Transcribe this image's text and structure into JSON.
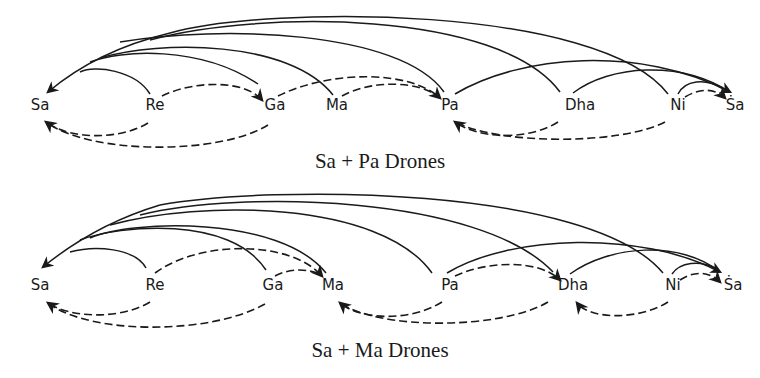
{
  "diagrams": [
    {
      "caption": "Sa + Pa Drones",
      "caption_pos": [
        380,
        168
      ],
      "label_y": 110,
      "notes": [
        {
          "id": "sa",
          "label": "Sa",
          "x": 40
        },
        {
          "id": "re",
          "label": "Re",
          "x": 155
        },
        {
          "id": "ga",
          "label": "Ga",
          "x": 275
        },
        {
          "id": "ma",
          "label": "Ma",
          "x": 337
        },
        {
          "id": "pa",
          "label": "Pa",
          "x": 450
        },
        {
          "id": "dha",
          "label": "Dha",
          "x": 580
        },
        {
          "id": "ni",
          "label": "Ni",
          "x": 678
        },
        {
          "id": "sa_upper",
          "label": "Ṡa",
          "x": 735
        }
      ],
      "solid_arcs": [
        {
          "from": "re",
          "to": "sa",
          "d": "M150,94 C135,70 95,65 80,72"
        },
        {
          "from": "ga",
          "to": "sa",
          "d": "M258,84 C200,45 120,50 90,62"
        },
        {
          "from": "ma",
          "to": "sa",
          "d": "M333,95 C290,40 160,40 100,58"
        },
        {
          "from": "pa",
          "to": "sa",
          "d": "M444,92 C400,30 220,25 120,42"
        },
        {
          "from": "dha",
          "to": "sa",
          "d": "M560,92 C500,10 260,10 150,40"
        },
        {
          "from": "ni",
          "to": "sa",
          "d": "M668,94 C600,5 270,5 170,33"
        },
        {
          "from": "sa_tail",
          "to": "sa",
          "d": "M170,33 C120,45 80,65 48,92",
          "arrow": "end"
        },
        {
          "from": "pa",
          "to": "sa_upper",
          "d": "M455,94 C520,55 640,45 730,92",
          "arrow": "end"
        },
        {
          "from": "dha",
          "to": "sa_upper",
          "d": "M573,93 C610,65 680,60 730,92"
        },
        {
          "from": "ni",
          "to": "sa_upper",
          "d": "M678,94 C685,80 705,78 722,88"
        }
      ],
      "dashed_arcs": [
        {
          "from": "re",
          "to": "ga",
          "d": "M162,96 C195,80 245,80 262,100",
          "arrow": "end"
        },
        {
          "from": "ga",
          "to": "pa",
          "d": "M278,96 C330,70 410,70 440,98",
          "arrow": "end"
        },
        {
          "from": "ma",
          "to": "pa",
          "d": "M342,96 C370,80 420,80 440,98"
        },
        {
          "from": "ni",
          "to": "sa_upper",
          "d": "M685,97 C700,88 715,88 725,98",
          "arrow": "end"
        },
        {
          "from": "re",
          "to": "sa",
          "d": "M148,123 C120,140 70,140 46,122",
          "arrow": "end"
        },
        {
          "from": "ga",
          "to": "sa",
          "d": "M268,125 C220,155 90,155 46,122"
        },
        {
          "from": "dha",
          "to": "pa",
          "d": "M558,122 C530,140 480,140 455,122",
          "arrow": "end"
        },
        {
          "from": "ni",
          "to": "pa",
          "d": "M665,122 C620,145 500,145 455,122"
        }
      ]
    },
    {
      "caption": "Sa + Ma Drones",
      "caption_pos": [
        380,
        357
      ],
      "label_y": 290,
      "notes": [
        {
          "id": "sa",
          "label": "Sa",
          "x": 40
        },
        {
          "id": "re",
          "label": "Re",
          "x": 155
        },
        {
          "id": "ga",
          "label": "Ga",
          "x": 273
        },
        {
          "id": "ma",
          "label": "Ma",
          "x": 333
        },
        {
          "id": "pa",
          "label": "Pa",
          "x": 450
        },
        {
          "id": "dha",
          "label": "Dha",
          "x": 573
        },
        {
          "id": "ni",
          "label": "Ni",
          "x": 673
        },
        {
          "id": "sa_upper",
          "label": "Ṡa",
          "x": 733
        }
      ],
      "solid_arcs": [
        {
          "from": "re",
          "to": "sa",
          "d": "M146,268 C135,248 95,245 70,252"
        },
        {
          "from": "ga",
          "to": "sa",
          "d": "M266,270 C230,215 120,225 80,240"
        },
        {
          "from": "ma",
          "to": "sa",
          "d": "M326,273 C280,215 130,220 90,238"
        },
        {
          "from": "pa",
          "to": "sa",
          "d": "M432,273 C380,200 200,200 110,225"
        },
        {
          "from": "dha",
          "to": "sa",
          "d": "M553,272 C480,195 240,190 140,215"
        },
        {
          "from": "ni",
          "to": "sa",
          "d": "M663,273 C590,185 270,185 160,205"
        },
        {
          "from": "sa_tail",
          "to": "sa",
          "d": "M160,205 C110,220 70,245 43,267",
          "arrow": "end"
        },
        {
          "from": "pa",
          "to": "sa_upper",
          "d": "M447,273 C510,235 640,230 720,272",
          "arrow": "end"
        },
        {
          "from": "dha",
          "to": "sa_upper",
          "d": "M570,274 C610,245 680,240 720,272"
        },
        {
          "from": "ni",
          "to": "sa_upper",
          "d": "M672,274 C680,262 700,260 715,268"
        }
      ],
      "dashed_arcs": [
        {
          "from": "re",
          "to": "ma",
          "d": "M155,273 C200,240 290,240 322,276",
          "arrow": "end"
        },
        {
          "from": "ga",
          "to": "ma",
          "d": "M275,276 C290,268 310,268 322,276"
        },
        {
          "from": "pa",
          "to": "dha",
          "d": "M455,276 C490,260 540,260 560,280",
          "arrow": "end"
        },
        {
          "from": "ni",
          "to": "sa_upper",
          "d": "M680,280 C695,270 710,272 720,282",
          "arrow": "end"
        },
        {
          "from": "re",
          "to": "sa",
          "d": "M150,302 C120,320 70,318 48,303",
          "arrow": "end"
        },
        {
          "from": "ga",
          "to": "sa",
          "d": "M265,304 C210,335 90,335 48,303"
        },
        {
          "from": "pa",
          "to": "ma",
          "d": "M442,302 C410,322 360,320 340,303",
          "arrow": "end"
        },
        {
          "from": "dha",
          "to": "ma",
          "d": "M548,302 C500,330 380,330 340,303"
        },
        {
          "from": "ni",
          "to": "dha",
          "d": "M668,302 C640,320 590,320 577,303",
          "arrow": "end"
        }
      ]
    }
  ]
}
